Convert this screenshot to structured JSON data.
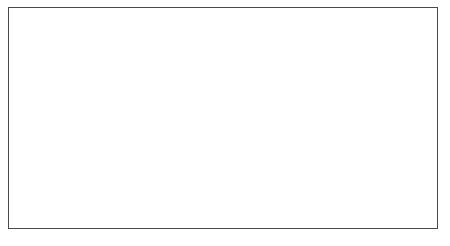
{
  "chart_data": {
    "type": "line",
    "title": "",
    "xlabel": "",
    "x": [
      1994,
      1995,
      1996,
      1997,
      1998,
      1999,
      2000,
      2001,
      2002,
      2003,
      2004,
      2005,
      2006,
      2007
    ],
    "x_tick_labels": [
      "1994",
      "1996",
      "1998",
      "2000",
      "2002",
      "2004",
      "2006"
    ],
    "x_tick_values": [
      1994,
      1996,
      1998,
      2000,
      2002,
      2004,
      2006
    ],
    "xlim": [
      1993.5,
      2007.5
    ],
    "grid": true,
    "legend_position": "top-right",
    "series": [
      {
        "name": "C cited",
        "axis": "left",
        "color": "#8c8c8c",
        "marker": "square",
        "values": [
          100,
          148,
          140,
          278,
          362,
          485,
          333,
          520,
          185,
          118,
          120,
          75,
          25,
          18
        ]
      },
      {
        "name": "N cited",
        "axis": "right",
        "color": "#1a1a1a",
        "marker": "diamond",
        "values": [
          10,
          15.5,
          20,
          23,
          28.5,
          47,
          28,
          32.5,
          29.5,
          24,
          28,
          31,
          21,
          22
        ]
      }
    ],
    "left_axis": {
      "label": "C cited",
      "ticks": [
        0,
        100,
        200,
        300,
        400,
        500,
        600
      ],
      "tick_labels": [
        "0",
        "100",
        "200",
        "300",
        "400",
        "500",
        "600"
      ],
      "ylim": [
        0,
        600
      ]
    },
    "right_axis": {
      "label": "N cited",
      "ticks": [
        0,
        5,
        10,
        15,
        20,
        25,
        30,
        35,
        40,
        45,
        50
      ],
      "tick_labels": [
        "0",
        "5",
        "10",
        "15",
        "20",
        "25",
        "30",
        "35",
        "40",
        "45",
        "50"
      ],
      "ylim": [
        0,
        50
      ]
    },
    "legend": [
      {
        "label": "C cited",
        "marker": "square",
        "color": "#8c8c8c"
      },
      {
        "label": "N cited",
        "marker": "diamond",
        "color": "#1a1a1a"
      }
    ]
  }
}
